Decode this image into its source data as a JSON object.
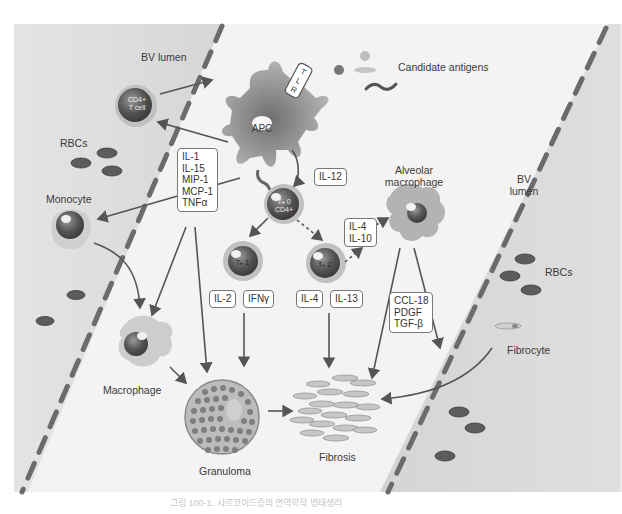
{
  "diagram": {
    "type": "biological pathway diagram",
    "colors": {
      "background": "#f2f2f2",
      "vessel_lumen": "#dcdcdc",
      "vessel_wall_dash": "#6b6b6b",
      "rbc": "#5a5a5a",
      "cell_dark": "#505050",
      "cell_light": "#b9b9b9",
      "arrow": "#555555"
    },
    "labels": {
      "bv_lumen_left": "BV lumen",
      "bv_lumen_right": "BV lumen",
      "rbcs_left": "RBCs",
      "rbcs_right": "RBCs",
      "monocyte": "Monocyte",
      "macrophage": "Macrophage",
      "granuloma": "Granuloma",
      "fibrosis": "Fibrosis",
      "fibrocyte": "Fibrocyte",
      "alveolar_macrophage": "Alveolar macrophage",
      "candidate_antigens": "Candidate antigens",
      "apc": "APC",
      "tlr": [
        "T",
        "L",
        "R"
      ],
      "cd4_tcell": "CD4+ T cell",
      "th0": "Tₕ 0 CD4+",
      "th1": "Tₕ 1",
      "th2": "Tₕ 2"
    },
    "cytokine_boxes": {
      "apc_secreted": [
        "IL-1",
        "IL-15",
        "MIP-1",
        "MCP-1",
        "TNFα"
      ],
      "il12": "IL-12",
      "th2_to_macrophage": [
        "IL-4",
        "IL-10"
      ],
      "th1_il2": "IL-2",
      "th1_ifng": "IFNγ",
      "th2_il4": "IL-4",
      "th2_il13": "IL-13",
      "alveolar_secreted": [
        "CCL-18",
        "PDGF",
        "TGF-β"
      ]
    },
    "caption": "그림 100-1. 사르코이드증의 면역학적 병태생리"
  }
}
